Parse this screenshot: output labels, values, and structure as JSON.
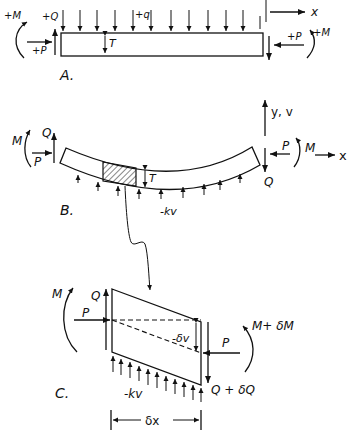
{
  "figure": {
    "panel_a": {
      "caption": "A.",
      "labels": {
        "moment_left": "+M",
        "shear_left": "+Q",
        "axial_left": "+P",
        "load": "+q",
        "thickness": "T",
        "axial_right": "+P",
        "moment_right": "+M",
        "x_axis": "x"
      }
    },
    "panel_b": {
      "caption": "B.",
      "labels": {
        "moment_left": "M",
        "shear_left": "Q",
        "axial_left": "P",
        "thickness": "T",
        "foundation": "-kv",
        "y_axis": "y, v",
        "axial_right": "P",
        "moment_right": "M",
        "x_axis": "x",
        "shear_right": "Q"
      }
    },
    "panel_c": {
      "caption": "C.",
      "labels": {
        "moment_left": "M",
        "shear_left": "Q",
        "axial_left": "P",
        "deflection": "-δv",
        "axial_right": "P",
        "moment_right": "M+ δM",
        "shear_right": "Q + δQ",
        "foundation": "-kv",
        "length": "δx"
      }
    },
    "colors": {
      "ink": "#111111",
      "background": "#ffffff"
    }
  }
}
